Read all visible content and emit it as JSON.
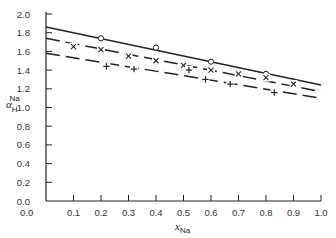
{
  "chart_data": {
    "type": "line",
    "title": "",
    "xlabel": "x_Na",
    "ylabel": "α_H^Na",
    "xlabel_main": "x",
    "xlabel_sub": "Na",
    "ylabel_main": "α",
    "ylabel_sub": "H",
    "ylabel_sup": "Na",
    "xlim": [
      0.0,
      1.0
    ],
    "ylim": [
      0.0,
      2.0
    ],
    "x_ticks": [
      "0.0",
      "0.1",
      "0.2",
      "0.3",
      "0.4",
      "0.5",
      "0.6",
      "0.7",
      "0.8",
      "0.9",
      "1.0"
    ],
    "y_ticks": [
      "0.0",
      "0.2",
      "0.4",
      "0.6",
      "0.8",
      "1.0",
      "1.2",
      "1.4",
      "1.6",
      "1.8",
      "2.0"
    ],
    "grid": false,
    "legend": null,
    "series": [
      {
        "name": "circles",
        "marker": "circle",
        "line": {
          "x": [
            0.0,
            1.0
          ],
          "y": [
            1.86,
            1.24
          ],
          "style": "solid"
        },
        "points": {
          "x": [
            0.2,
            0.4,
            0.6,
            0.8
          ],
          "y": [
            1.74,
            1.64,
            1.49,
            1.36
          ]
        }
      },
      {
        "name": "crosses",
        "marker": "x",
        "line": {
          "x": [
            0.0,
            1.0
          ],
          "y": [
            1.74,
            1.17
          ],
          "style": "dashed"
        },
        "points": {
          "x": [
            0.1,
            0.2,
            0.3,
            0.4,
            0.5,
            0.6,
            0.7,
            0.8,
            0.9
          ],
          "y": [
            1.65,
            1.62,
            1.55,
            1.5,
            1.45,
            1.4,
            1.36,
            1.32,
            1.25
          ]
        }
      },
      {
        "name": "pluses",
        "marker": "plus",
        "line": {
          "x": [
            0.0,
            1.0
          ],
          "y": [
            1.58,
            1.1
          ],
          "style": "dashed"
        },
        "points": {
          "x": [
            0.22,
            0.32,
            0.52,
            0.58,
            0.67,
            0.83
          ],
          "y": [
            1.44,
            1.41,
            1.4,
            1.3,
            1.25,
            1.16
          ]
        }
      }
    ]
  }
}
